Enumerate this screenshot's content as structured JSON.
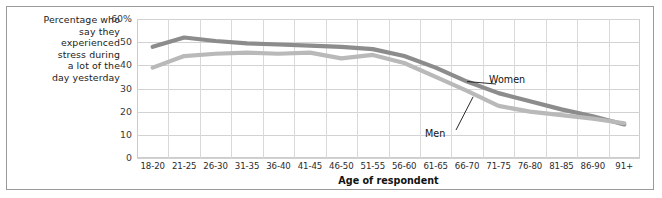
{
  "figure": {
    "y_axis_caption_lines": [
      "Percentage who",
      "say they",
      "experienced",
      "stress during",
      "a lot of the",
      "day yesterday"
    ],
    "colors": {
      "women_line": "#8c8c8c",
      "men_line": "#b9b9b9",
      "gridline": "#d4d4d4",
      "frame_border": "#9a9a9a",
      "text": "#1b1b1b"
    }
  },
  "chart_data": {
    "type": "line",
    "title": "",
    "subtitle": "",
    "xlabel": "Age of respondent",
    "ylabel": "Percentage who say they experienced stress during a lot of the day yesterday",
    "ylim": [
      0,
      60
    ],
    "yticks": [
      60,
      50,
      40,
      30,
      20,
      10,
      0
    ],
    "ytick_labels": [
      "60%",
      "50",
      "40",
      "30",
      "20",
      "10",
      "0"
    ],
    "grid": true,
    "legend_position": "inline-annotation",
    "categories": [
      "18-20",
      "21-25",
      "26-30",
      "31-35",
      "36-40",
      "41-45",
      "46-50",
      "51-55",
      "56-60",
      "61-65",
      "66-70",
      "71-75",
      "76-80",
      "81-85",
      "86-90",
      "91+"
    ],
    "series": [
      {
        "name": "Women",
        "color": "#8c8c8c",
        "values": [
          48,
          52,
          50.5,
          49.5,
          49,
          48.5,
          48,
          47,
          44,
          39,
          33,
          28,
          24.5,
          21,
          18,
          14.5
        ]
      },
      {
        "name": "Men",
        "color": "#b9b9b9",
        "values": [
          39,
          44,
          45,
          45.5,
          45,
          45.5,
          43,
          44.5,
          41,
          35,
          29,
          22.5,
          20,
          18.5,
          17,
          15
        ]
      }
    ],
    "annotations": [
      {
        "text": "Women",
        "series": "Women",
        "points_to_category": "66-70"
      },
      {
        "text": "Men",
        "series": "Men",
        "points_to_category": "66-70"
      }
    ]
  }
}
